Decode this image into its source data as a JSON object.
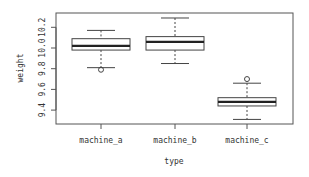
{
  "chart_data": {
    "type": "boxplot",
    "title": "",
    "xlabel": "type",
    "ylabel": "weight",
    "categories": [
      "machine_a",
      "machine_b",
      "machine_c"
    ],
    "ylim": [
      9.3,
      10.33
    ],
    "yticks": [
      9.4,
      9.6,
      9.8,
      10.0,
      10.2
    ],
    "ytick_labels": [
      "9.4",
      "9.6",
      "9.8",
      "10.0",
      "10.2"
    ],
    "grid": false,
    "legend": null,
    "boxes": [
      {
        "name": "machine_a",
        "whisker_low": 9.81,
        "q1": 9.98,
        "median": 10.02,
        "q3": 10.09,
        "whisker_high": 10.17,
        "outliers": [
          9.79
        ]
      },
      {
        "name": "machine_b",
        "whisker_low": 9.85,
        "q1": 9.98,
        "median": 10.06,
        "q3": 10.11,
        "whisker_high": 10.29,
        "outliers": []
      },
      {
        "name": "machine_c",
        "whisker_low": 9.31,
        "q1": 9.44,
        "median": 9.48,
        "q3": 9.52,
        "whisker_high": 9.66,
        "outliers": [
          9.7
        ]
      }
    ]
  }
}
